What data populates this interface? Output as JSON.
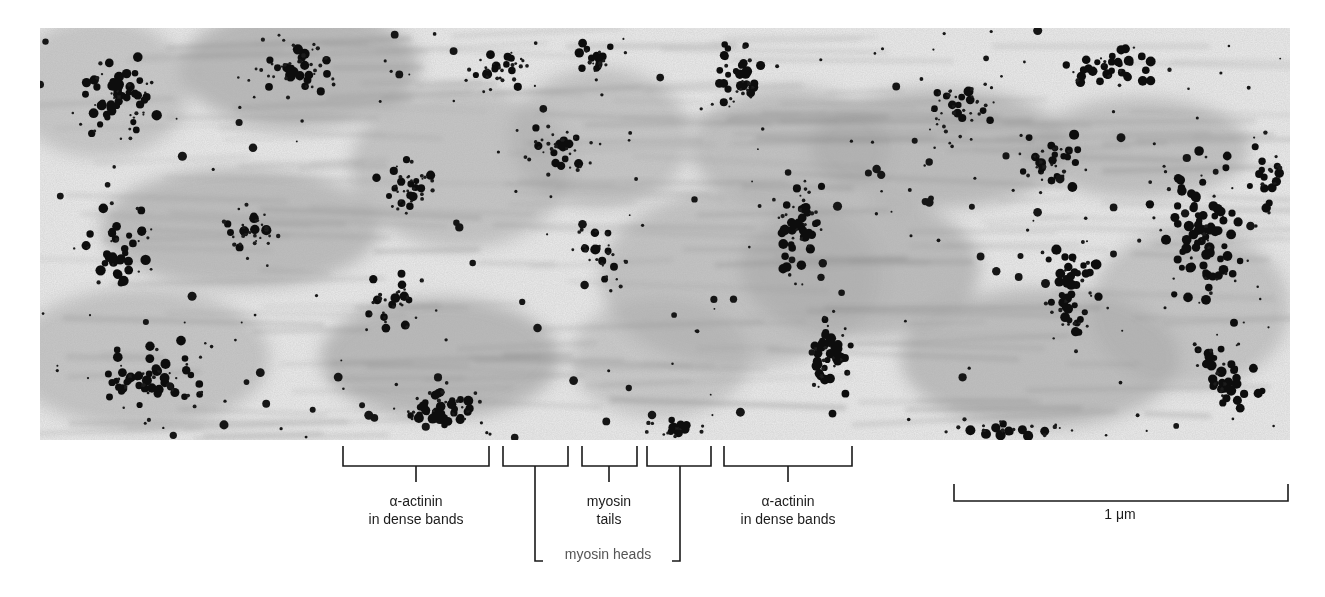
{
  "figure": {
    "micrograph": {
      "description": "electron micrograph with gold-particle immunolabeling",
      "background_color": "#e9e9e9",
      "particle_color": "#111111",
      "band_color": "#8a8a8a"
    },
    "annotations": {
      "alpha_actinin_left": {
        "line1": "α-actinin",
        "line2": "in dense bands"
      },
      "myosin_tails": {
        "line1": "myosin",
        "line2": "tails"
      },
      "myosin_heads": {
        "label": "myosin heads"
      },
      "alpha_actinin_right": {
        "line1": "α-actinin",
        "line2": "in dense bands"
      }
    },
    "scale_bar": {
      "label": "1 μm",
      "length_px": 334
    }
  }
}
